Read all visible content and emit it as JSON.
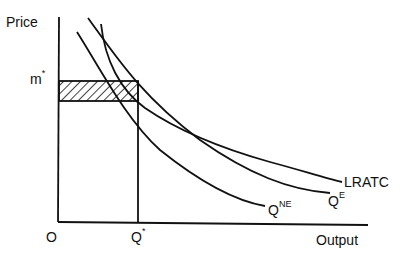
{
  "diagram": {
    "type": "economics-cost-curves",
    "axes": {
      "y_label": "Price",
      "x_label": "Output",
      "origin_label": "O"
    },
    "markers": {
      "price_level": {
        "base": "m",
        "sup": "*"
      },
      "quantity_level": {
        "base": "Q",
        "sup": "*"
      }
    },
    "curves": [
      {
        "name": "LRATC",
        "label": "LRATC"
      },
      {
        "name": "Q_E",
        "label_base": "Q",
        "label_sup": "E"
      },
      {
        "name": "Q_NE",
        "label_base": "Q",
        "label_sup": "NE"
      }
    ],
    "shaded_region": "hatched rectangle between m* and the lower curve intersection, from O to Q*",
    "colors": {
      "line": "#111111",
      "background": "#ffffff"
    }
  }
}
